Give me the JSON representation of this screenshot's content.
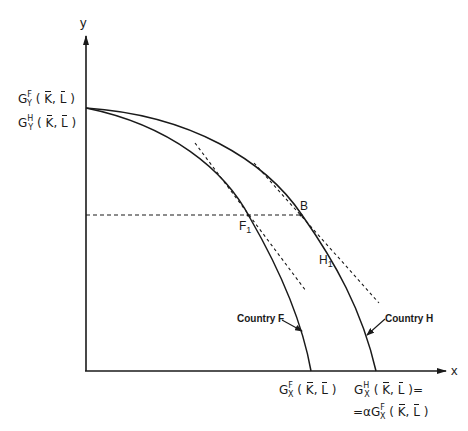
{
  "diagram": {
    "type": "production-possibility-frontier",
    "axes": {
      "x_label": "x",
      "y_label": "y"
    },
    "y_intercepts": {
      "upper": {
        "G": "G",
        "sup": "F",
        "sub": "Y",
        "args_open": "(",
        "K": "K",
        "comma": ",",
        "L": "L",
        "args_close": ")"
      },
      "lower": {
        "G": "G",
        "sup": "H",
        "sub": "Y",
        "args_open": "(",
        "K": "K",
        "comma": ",",
        "L": "L",
        "args_close": ")"
      }
    },
    "x_intercepts": {
      "country_f": {
        "G": "G",
        "sup": "F",
        "sub": "X",
        "args_open": "(",
        "K": "K",
        "comma": ",",
        "L": "L",
        "args_close": ")"
      },
      "country_h_line1": {
        "G": "G",
        "sup": "H",
        "sub": "X",
        "args_open": "(",
        "K": "K",
        "comma": ",",
        "L": "L",
        "args_close": ")="
      },
      "country_h_line2": {
        "prefix": "=αG",
        "sup": "F",
        "sub": "X",
        "args_open": "(",
        "K": "K",
        "comma": ",",
        "L": "L",
        "args_close": ")"
      }
    },
    "curves": [
      {
        "name": "Country F",
        "label": "Country F"
      },
      {
        "name": "Country H",
        "label": "Country H"
      }
    ],
    "points": {
      "B": "B",
      "F1": {
        "main": "F",
        "sub": "1"
      },
      "H1": {
        "main": "H",
        "sub": "1"
      }
    },
    "colors": {
      "ink": "#1a1a1a",
      "background": "#ffffff"
    }
  }
}
